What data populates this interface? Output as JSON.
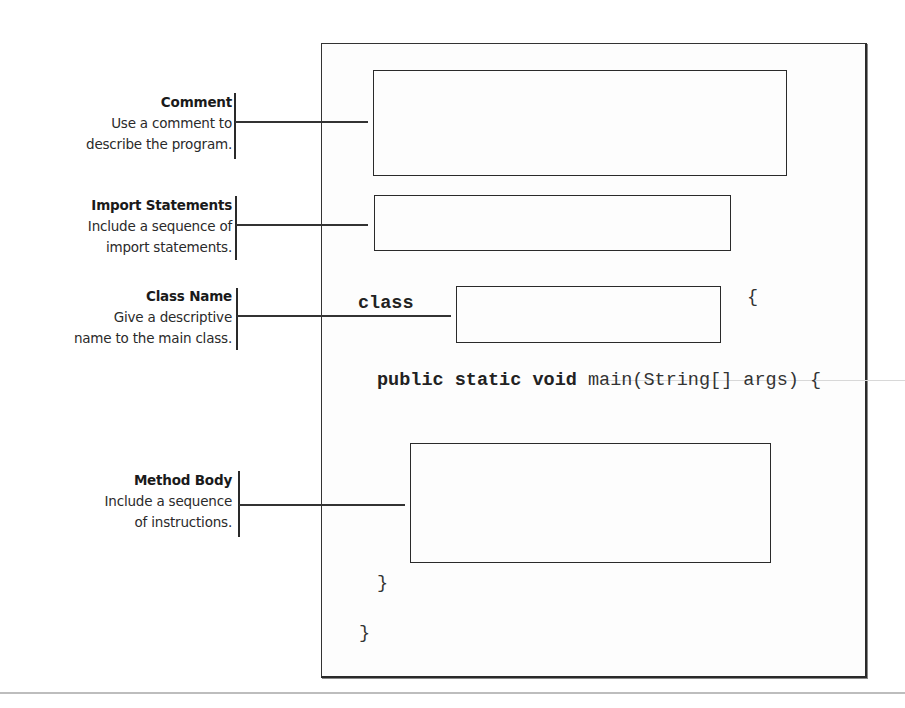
{
  "diagram": {
    "annotations": [
      {
        "id": "comment",
        "title": "Comment",
        "lines": [
          "Use a comment to",
          "describe the program."
        ]
      },
      {
        "id": "import",
        "title": "Import Statements",
        "lines": [
          "Include a sequence of",
          "import statements."
        ]
      },
      {
        "id": "class",
        "title": "Class Name",
        "lines": [
          "Give a descriptive",
          "name to the main class."
        ]
      },
      {
        "id": "method",
        "title": "Method Body",
        "lines": [
          "Include a sequence",
          "of instructions."
        ]
      }
    ],
    "code": {
      "class_keyword": "class",
      "class_open_brace": "{",
      "method_modifiers": "public static void",
      "method_signature": " main(String[] args) {",
      "method_close_brace": "}",
      "class_close_brace": "}"
    },
    "slots": [
      {
        "id": "comment-slot",
        "connects_to": "comment"
      },
      {
        "id": "import-slot",
        "connects_to": "import"
      },
      {
        "id": "class-name-slot",
        "connects_to": "class"
      },
      {
        "id": "method-body-slot",
        "connects_to": "method"
      }
    ]
  }
}
